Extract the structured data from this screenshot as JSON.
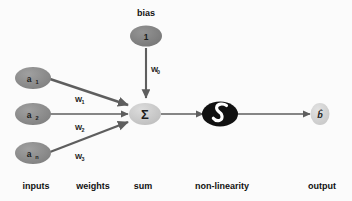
{
  "diagram": {
    "title_role": "artificial-neuron-schematic",
    "colors": {
      "background": "#fbfbfb",
      "input_node_fill": "#8a8a8a",
      "bias_node_fill": "#7e7e7e",
      "sum_node_fill": "#c9c9c9",
      "nonlinearity_node_fill": "#111111",
      "nonlinearity_glyph": "#ffffff",
      "output_node_fill": "#d6d6d6",
      "edge_stroke": "#5e5e5e",
      "text": "#1c1c1c"
    },
    "bias": {
      "caption": "bias",
      "node_value": "1",
      "weight_label": "W",
      "weight_subscript": "0"
    },
    "inputs": [
      {
        "label": "a",
        "subscript": "1",
        "weight_label": "W",
        "weight_subscript": "1"
      },
      {
        "label": "a",
        "subscript": "2",
        "weight_label": "W",
        "weight_subscript": "2"
      },
      {
        "label": "a",
        "subscript": "n",
        "weight_label": "W",
        "weight_subscript": "3"
      }
    ],
    "sum_node": {
      "symbol": "Σ"
    },
    "nonlinearity_node": {
      "glyph_name": "sigmoid-curve"
    },
    "output_node": {
      "symbol": "b̂"
    },
    "column_labels": [
      {
        "text": "inputs"
      },
      {
        "text": "weights"
      },
      {
        "text": "sum"
      },
      {
        "text": "non-linearity"
      },
      {
        "text": "output"
      }
    ]
  }
}
